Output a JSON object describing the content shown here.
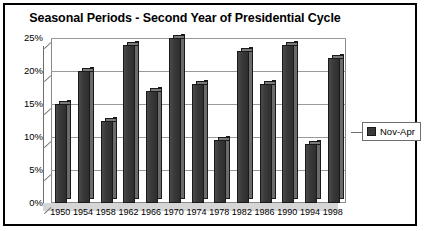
{
  "chart_data": {
    "type": "bar",
    "title": "Seasonal Periods - Second Year of Presidential Cycle",
    "xlabel": "",
    "ylabel": "",
    "ylim": [
      0,
      25
    ],
    "ytick_labels": [
      "25%",
      "20%",
      "15%",
      "10%",
      "5%",
      "0%"
    ],
    "ytick_values": [
      25,
      20,
      15,
      10,
      5,
      0
    ],
    "grid": true,
    "legend_position": "right",
    "categories": [
      "1950",
      "1954",
      "1958",
      "1962",
      "1966",
      "1970",
      "1974",
      "1978",
      "1982",
      "1986",
      "1990",
      "1994",
      "1998"
    ],
    "series": [
      {
        "name": "Nov-Apr",
        "color": "#3a3a3a",
        "values": [
          15.0,
          20.0,
          12.5,
          24.0,
          17.0,
          25.0,
          18.0,
          9.5,
          23.0,
          18.0,
          24.0,
          9.0,
          22.0
        ]
      }
    ]
  },
  "legend": {
    "entries": [
      {
        "label": "Nov-Apr",
        "swatch_name": "legend-swatch-nov-apr"
      }
    ]
  },
  "colors": {
    "border": "#000000",
    "background": "#ffffff",
    "bar_front": "#3a3a3a",
    "bar_side": "#6b6b6b",
    "bar_top": "#7a7a7a",
    "gridline": "#9a9a9a",
    "floor": "#d6d6d6"
  }
}
